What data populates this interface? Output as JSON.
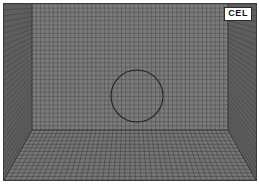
{
  "figure": {
    "title": "CEL",
    "badge_label": "CEL",
    "frame_color": "#3b3b3b",
    "background_color": "#ffffff"
  },
  "colors": {
    "void_fill": "#ffffff",
    "material_fill": "#6d6d6d",
    "material_fill_dark": "#5a5a5a",
    "floor_fill": "#767676",
    "grid_line_void": "#9a9a9a",
    "grid_line_minor_void": "#c7c7c7",
    "grid_line_material": "#3a3a3a",
    "grid_line_minor_material": "#545454",
    "outline": "#222222",
    "badge_text": "#111111"
  },
  "mesh": {
    "type": "eulerian-cel-mesh",
    "front_cell_size_px": 4.3,
    "front_columns": 58,
    "front_rows": 40,
    "floor_rows": 14,
    "grid_visible": true,
    "perspective": true
  },
  "geometry": {
    "domain": {
      "x": 0,
      "y": 0,
      "width": 252,
      "height": 176
    },
    "vanishing_box": {
      "left_x": 0,
      "right_x": 252,
      "back_left_x": 28,
      "back_right_x": 224,
      "back_top_y": 126,
      "front_bottom_y": 176,
      "label": "eulerian-domain-box"
    },
    "circle": {
      "label": "rigid-cylinder",
      "center_x": 133,
      "center_y": 92,
      "radius": 26,
      "stroke": "#222222",
      "stroke_width": 1,
      "fill": "none"
    },
    "material_surface_profile": {
      "label": "granular-material-free-surface",
      "points": [
        [
          0,
          78
        ],
        [
          6,
          75
        ],
        [
          14,
          72
        ],
        [
          24,
          69
        ],
        [
          34,
          66
        ],
        [
          44,
          63
        ],
        [
          54,
          61
        ],
        [
          62,
          60
        ],
        [
          70,
          60
        ],
        [
          76,
          61
        ],
        [
          82,
          64
        ],
        [
          87,
          69
        ],
        [
          92,
          75
        ],
        [
          97,
          82
        ],
        [
          102,
          89
        ],
        [
          107,
          96
        ],
        [
          112,
          102
        ],
        [
          117,
          107
        ],
        [
          122,
          111
        ],
        [
          127,
          114
        ],
        [
          132,
          116
        ],
        [
          142,
          116
        ],
        [
          150,
          113
        ],
        [
          156,
          108
        ],
        [
          160,
          101
        ],
        [
          163,
          92
        ],
        [
          165,
          82
        ],
        [
          167,
          71
        ],
        [
          169,
          61
        ],
        [
          172,
          52
        ],
        [
          176,
          45
        ],
        [
          181,
          41
        ],
        [
          187,
          41
        ],
        [
          193,
          44
        ],
        [
          198,
          49
        ],
        [
          203,
          55
        ],
        [
          208,
          60
        ],
        [
          214,
          64
        ],
        [
          221,
          67
        ],
        [
          230,
          69
        ],
        [
          240,
          71
        ],
        [
          252,
          72
        ]
      ]
    }
  },
  "annotations": {
    "scene_description": "Coupled Eulerian-Lagrangian mesh domain with granular material and rigid circular body",
    "visible_text": [
      "CEL"
    ]
  }
}
